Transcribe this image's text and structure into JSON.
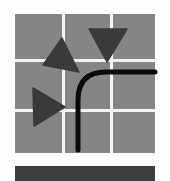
{
  "figure": {
    "kind": "icon-illustration",
    "colors": {
      "background": "#fdfdfd",
      "tile": "#8c8c8c",
      "gutter": "#f4f4f4",
      "triangle": "#3a3a3a",
      "curve": "#0a0a0a",
      "bar": "#3e3e3e"
    },
    "grid": {
      "rows": 3,
      "cols": 3,
      "x": 15,
      "y": 14,
      "width": 140,
      "height": 139,
      "col_dividers_x": [
        62,
        110
      ],
      "row_dividers_y": [
        59,
        109
      ],
      "gutter_width": 3
    },
    "triangles": [
      {
        "name": "triangle-up-left",
        "points": "62,38 43,65 79,72"
      },
      {
        "name": "triangle-down",
        "points": "89,29 127,29 107,62"
      },
      {
        "name": "triangle-right",
        "points": "33,88 34,126 65,107"
      }
    ],
    "curve": {
      "path": "M 78 150 L 78 100 Q 78 72 106 72 L 155 72",
      "stroke_width": 5
    },
    "bar": {
      "x": 15,
      "y": 166,
      "width": 140,
      "height": 15
    }
  }
}
